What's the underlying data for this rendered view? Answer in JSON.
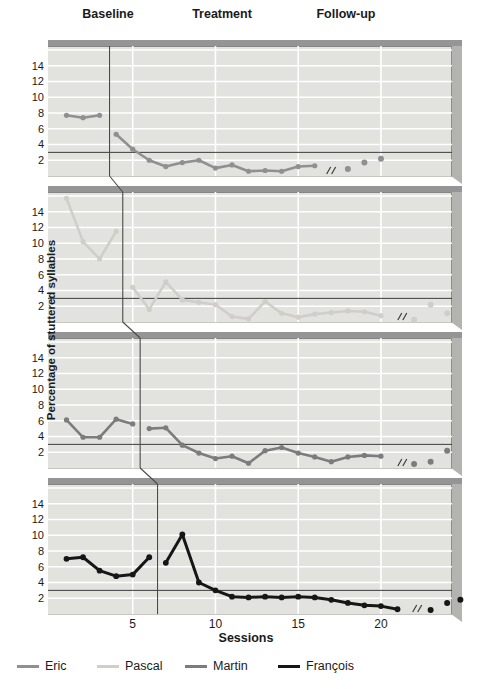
{
  "chart_data": {
    "type": "line",
    "xlabel": "Sessions",
    "ylabel": "Percentage of stuttered syllables",
    "phases": [
      "Baseline",
      "Treatment",
      "Follow-up"
    ],
    "ylim": [
      0,
      16.5
    ],
    "xlim": [
      0.5,
      25
    ],
    "y_ticks": [
      2,
      4,
      6,
      8,
      10,
      12,
      14
    ],
    "x_ticks": [
      5,
      10,
      15,
      20
    ],
    "grid": "white horizontal lines every 2 units and vertical lines at x ticks on gray panel background",
    "criterion_line_y": 3,
    "panel_bg_color": "#e2e2df",
    "gridline_color": "#ffffff",
    "criterion_line_color": "#3c3c3c",
    "phase_line_color": "#4a4a4a",
    "panels": [
      {
        "participant": "Eric",
        "color": "#909090",
        "phase_change_session": 3.6,
        "baseline": {
          "sessions": [
            1,
            2,
            3
          ],
          "values": [
            7.7,
            7.4,
            7.7
          ]
        },
        "treatment": {
          "sessions": [
            4,
            5,
            6,
            7,
            8,
            9,
            10,
            11,
            12,
            13,
            14,
            15,
            16
          ],
          "values": [
            5.3,
            3.4,
            2.0,
            1.2,
            1.7,
            2.0,
            1.0,
            1.4,
            0.6,
            0.7,
            0.6,
            1.2,
            1.3
          ]
        },
        "break_session": 16.9,
        "followup": {
          "sessions": [
            18,
            19,
            20
          ],
          "values": [
            0.9,
            1.7,
            2.2
          ]
        }
      },
      {
        "participant": "Pascal",
        "color": "#cfcec8",
        "phase_change_session": 4.4,
        "baseline": {
          "sessions": [
            1,
            2,
            3,
            4
          ],
          "values": [
            15.7,
            10.2,
            8.0,
            11.5
          ]
        },
        "treatment": {
          "sessions": [
            5,
            6,
            7,
            8,
            9,
            10,
            11,
            12,
            13,
            14,
            15,
            16,
            17,
            18,
            19,
            20
          ],
          "values": [
            4.4,
            1.6,
            5.1,
            2.8,
            2.5,
            2.2,
            0.7,
            0.4,
            2.6,
            1.1,
            0.6,
            1.0,
            1.2,
            1.4,
            1.3,
            0.8
          ]
        },
        "break_session": 21.2,
        "followup": {
          "sessions": [
            22,
            23,
            24
          ],
          "values": [
            0.3,
            2.2,
            1.1
          ]
        }
      },
      {
        "participant": "Martin",
        "color": "#7c7c7c",
        "phase_change_session": 5.45,
        "baseline": {
          "sessions": [
            1,
            2,
            3,
            4,
            5
          ],
          "values": [
            6.1,
            3.9,
            3.9,
            6.2,
            5.6
          ]
        },
        "treatment": {
          "sessions": [
            6,
            7,
            8,
            9,
            10,
            11,
            12,
            13,
            14,
            15,
            16,
            17,
            18,
            19,
            20
          ],
          "values": [
            5.0,
            5.1,
            2.9,
            1.9,
            1.2,
            1.5,
            0.6,
            2.2,
            2.6,
            1.9,
            1.4,
            0.8,
            1.4,
            1.6,
            1.5
          ]
        },
        "break_session": 21.2,
        "followup": {
          "sessions": [
            22,
            23,
            24
          ],
          "values": [
            0.5,
            0.8,
            2.2
          ]
        }
      },
      {
        "participant": "François",
        "color": "#161616",
        "phase_change_session": 6.5,
        "baseline": {
          "sessions": [
            1,
            2,
            3,
            4,
            5,
            6
          ],
          "values": [
            7.0,
            7.2,
            5.5,
            4.8,
            5.0,
            7.2
          ]
        },
        "treatment": {
          "sessions": [
            7,
            8,
            9,
            10,
            11,
            12,
            13,
            14,
            15,
            16,
            17,
            18,
            19,
            20,
            21
          ],
          "values": [
            6.5,
            10.1,
            4.0,
            3.0,
            2.2,
            2.1,
            2.2,
            2.1,
            2.2,
            2.1,
            1.8,
            1.4,
            1.1,
            1.0,
            0.6
          ]
        },
        "break_session": 22.1,
        "followup": {
          "sessions": [
            23,
            24,
            24.8
          ],
          "values": [
            0.5,
            1.4,
            1.8
          ]
        }
      }
    ],
    "legend": [
      {
        "label": "Eric",
        "color": "#909090"
      },
      {
        "label": "Pascal",
        "color": "#cfcec8"
      },
      {
        "label": "Martin",
        "color": "#7c7c7c"
      },
      {
        "label": "François",
        "color": "#161616"
      }
    ],
    "legend_position": "bottom"
  }
}
